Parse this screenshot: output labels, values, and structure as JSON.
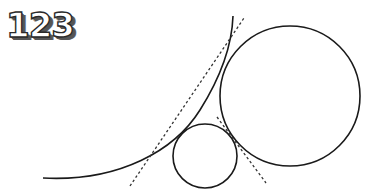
{
  "label": {
    "text": "123"
  },
  "diagram": {
    "stroke_color": "#1a1a1a",
    "background": "#ffffff",
    "large_curve": {
      "start": [
        43,
        178
      ],
      "end": [
        233,
        16
      ]
    },
    "large_circle": {
      "cx": 290,
      "cy": 96,
      "r": 70
    },
    "small_circle": {
      "cx": 205,
      "cy": 156,
      "r": 32
    },
    "tangent_lines": [
      {
        "from": [
          130,
          186
        ],
        "to": [
          244,
          18
        ],
        "style": "dashed"
      },
      {
        "from": [
          217,
          117
        ],
        "to": [
          266,
          183
        ],
        "style": "dashed"
      }
    ]
  }
}
